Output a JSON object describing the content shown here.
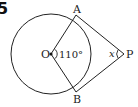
{
  "problem_number": "5",
  "points": {
    "O": "O",
    "A": "A",
    "B": "B",
    "P": "P"
  },
  "angle_AOB": "110°",
  "angle_APB": "x",
  "geometry": {
    "circle": {
      "cx": 51,
      "cy": 54,
      "r": 40
    },
    "A": [
      76,
      15
    ],
    "B": [
      76,
      92
    ],
    "O": [
      51,
      54
    ],
    "P": [
      124,
      54
    ]
  },
  "colors": {
    "stroke": "#222222",
    "background": "#ffffff"
  }
}
